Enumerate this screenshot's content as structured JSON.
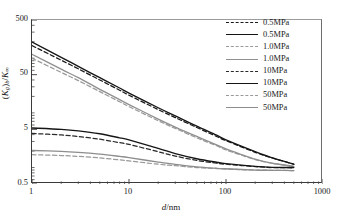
{
  "chart_data": {
    "type": "line",
    "title": "",
    "xlabel": "d/nm",
    "ylabel": "(Kg)b/K∞",
    "xscale": "log",
    "yscale": "log",
    "xlim": [
      1,
      1000
    ],
    "ylim": [
      0.5,
      500
    ],
    "xticks": [
      "1",
      "10",
      "100",
      "1000"
    ],
    "xtick_values": [
      1,
      10,
      100,
      1000
    ],
    "yticks": [
      "0.5",
      "5",
      "50",
      "500"
    ],
    "ytick_values": [
      0.5,
      5,
      50,
      500
    ],
    "grid": false,
    "legend_position": "top-right",
    "minor_ticks": true,
    "series": [
      {
        "name": "0.5MPa",
        "style": "dashed",
        "color": "#1a1a1a",
        "x": [
          1,
          2,
          3,
          5,
          8,
          10,
          20,
          30,
          50,
          80,
          100,
          200,
          300,
          500
        ],
        "y": [
          170,
          92,
          64,
          40,
          26,
          21,
          11.5,
          8.2,
          5.4,
          3.7,
          3.1,
          1.9,
          1.5,
          1.15
        ]
      },
      {
        "name": "0.5MPa",
        "style": "solid",
        "color": "#151515",
        "x": [
          1,
          2,
          3,
          5,
          8,
          10,
          20,
          30,
          50,
          80,
          100,
          200,
          300,
          500
        ],
        "y": [
          197,
          104,
          71,
          44,
          28.5,
          23,
          12.4,
          8.8,
          5.7,
          3.9,
          3.2,
          1.95,
          1.5,
          1.15
        ]
      },
      {
        "name": "1.0MPa",
        "style": "dashed",
        "color": "#9a9a9a",
        "x": [
          1,
          2,
          3,
          5,
          8,
          10,
          20,
          30,
          50,
          80,
          100,
          200,
          300,
          500
        ],
        "y": [
          100,
          55,
          39,
          24.5,
          16,
          13,
          7.2,
          5.2,
          3.5,
          2.5,
          2.1,
          1.4,
          1.2,
          1.05
        ]
      },
      {
        "name": "1.0MPa",
        "style": "solid",
        "color": "#909090",
        "x": [
          1,
          2,
          3,
          5,
          8,
          10,
          20,
          30,
          50,
          80,
          100,
          200,
          300,
          500
        ],
        "y": [
          118,
          63,
          44,
          27,
          17.5,
          14.2,
          7.7,
          5.5,
          3.7,
          2.6,
          2.2,
          1.42,
          1.2,
          1.05
        ]
      },
      {
        "name": "10MPa",
        "style": "dashed",
        "color": "#2a2a2a",
        "x": [
          1,
          2,
          3,
          5,
          8,
          10,
          20,
          30,
          50,
          80,
          100,
          200,
          300,
          500
        ],
        "y": [
          4.2,
          3.95,
          3.7,
          3.3,
          2.85,
          2.65,
          1.95,
          1.62,
          1.35,
          1.2,
          1.15,
          1.04,
          1.0,
          0.99
        ]
      },
      {
        "name": "10MPa",
        "style": "solid",
        "color": "#151515",
        "x": [
          1,
          2,
          3,
          5,
          8,
          10,
          20,
          30,
          50,
          80,
          100,
          200,
          300,
          500
        ],
        "y": [
          5.3,
          5.0,
          4.7,
          4.15,
          3.5,
          3.2,
          2.25,
          1.8,
          1.45,
          1.25,
          1.18,
          1.05,
          1.01,
          1.0
        ]
      },
      {
        "name": "50MPa",
        "style": "dashed",
        "color": "#9a9a9a",
        "x": [
          1,
          2,
          3,
          5,
          8,
          10,
          20,
          30,
          50,
          80,
          100,
          200,
          300,
          500
        ],
        "y": [
          1.72,
          1.66,
          1.6,
          1.5,
          1.38,
          1.32,
          1.15,
          1.08,
          1.0,
          0.96,
          0.94,
          0.9,
          0.89,
          0.88
        ]
      },
      {
        "name": "50MPa",
        "style": "solid",
        "color": "#8d8d8d",
        "x": [
          1,
          2,
          3,
          5,
          8,
          10,
          20,
          30,
          50,
          80,
          100,
          200,
          300,
          500
        ],
        "y": [
          2.05,
          1.98,
          1.9,
          1.76,
          1.6,
          1.52,
          1.26,
          1.14,
          1.03,
          0.97,
          0.95,
          0.9,
          0.89,
          0.88
        ]
      }
    ],
    "legend": [
      {
        "label": "0.5MPa",
        "style": "dashed",
        "color": "#1a1a1a"
      },
      {
        "label": "0.5MPa",
        "style": "solid",
        "color": "#151515"
      },
      {
        "label": "1.0MPa",
        "style": "dashed",
        "color": "#9a9a9a"
      },
      {
        "label": "1.0MPa",
        "style": "solid",
        "color": "#909090"
      },
      {
        "label": "10MPa",
        "style": "dashed",
        "color": "#2a2a2a"
      },
      {
        "label": "10MPa",
        "style": "solid",
        "color": "#151515"
      },
      {
        "label": "50MPa",
        "style": "dashed",
        "color": "#9a9a9a"
      },
      {
        "label": "50MPa",
        "style": "solid",
        "color": "#8d8d8d"
      }
    ]
  },
  "axis_titles": {
    "x_main": "d",
    "x_rest": "/nm",
    "y_open": "(",
    "y_k": "K",
    "y_g": "g",
    "y_close": ")",
    "y_b": "b",
    "y_slash": "/",
    "y_k2": "K",
    "y_inf": "∞"
  }
}
